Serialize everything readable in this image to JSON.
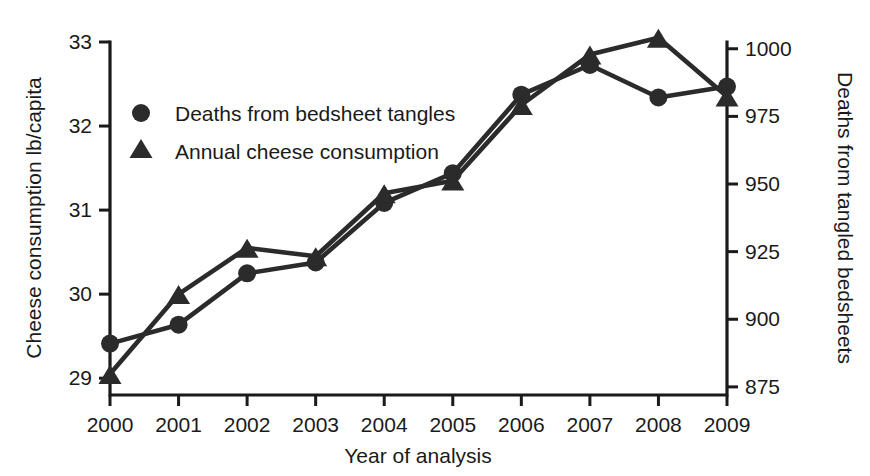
{
  "figure": {
    "background_color": "#ffffff",
    "ink_color": "#2b2b2b"
  },
  "chart_data": {
    "type": "line",
    "title": "",
    "subtitle": "",
    "xlabel": "Year of analysis",
    "categories": [
      "2000",
      "2001",
      "2002",
      "2003",
      "2004",
      "2005",
      "2006",
      "2007",
      "2008",
      "2009"
    ],
    "x": [
      2000,
      2001,
      2002,
      2003,
      2004,
      2005,
      2006,
      2007,
      2008,
      2009
    ],
    "xlim": [
      2000,
      2009
    ],
    "grid": false,
    "legend_position": "upper-left-inside",
    "axes": [
      {
        "id": "left",
        "label": "Cheese consumption lb/capita",
        "ticks": [
          29,
          30,
          31,
          32,
          33
        ],
        "ticklabels": [
          "29",
          "30",
          "31",
          "32",
          "33"
        ],
        "lim": [
          28.8,
          33.0
        ]
      },
      {
        "id": "right",
        "label": "Deaths from tangled bedsheets",
        "ticks": [
          875,
          900,
          925,
          950,
          975,
          1000
        ],
        "ticklabels": [
          "875",
          "900",
          "925",
          "950",
          "975",
          "1000"
        ],
        "lim": [
          872.0,
          1002.5
        ]
      }
    ],
    "series": [
      {
        "name": "Deaths from bedsheet tangles",
        "marker": "circle",
        "axis": "right",
        "values": [
          891,
          898,
          917,
          921,
          943,
          954,
          983,
          994,
          982,
          986
        ]
      },
      {
        "name": "Annual cheese consumption",
        "marker": "triangle",
        "axis": "left",
        "values": [
          29.05,
          30.0,
          30.55,
          30.45,
          31.2,
          31.35,
          32.25,
          32.85,
          33.05,
          32.35
        ]
      }
    ],
    "legend": [
      {
        "marker": "circle",
        "label": "Deaths from bedsheet tangles"
      },
      {
        "marker": "triangle",
        "label": "Annual cheese consumption"
      }
    ]
  }
}
